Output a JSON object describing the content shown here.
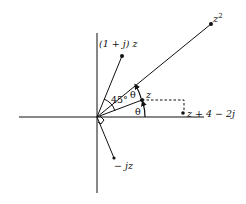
{
  "diagram": {
    "colors": {
      "line": "#111111",
      "background": "#ffffff"
    },
    "origin": {
      "x": 97,
      "y": 117
    },
    "axes": {
      "horizontal": {
        "x1": 19,
        "x2": 204,
        "y": 117
      },
      "vertical": {
        "x": 97,
        "y1": 33,
        "y2": 193
      }
    },
    "points": [
      {
        "id": "z2",
        "label": "z²",
        "label_base": "z",
        "label_sup": "2",
        "x": 211,
        "y": 24
      },
      {
        "id": "one_plus_j_z",
        "label": "(1 + j) z",
        "x": 122,
        "y": 56
      },
      {
        "id": "z",
        "label": "z",
        "x": 142,
        "y": 100
      },
      {
        "id": "z_plus_4_minus_2j",
        "label": "z + 4 − 2j",
        "x": 182,
        "y": 113
      },
      {
        "id": "minus_jz",
        "label": "− jz",
        "x": 114,
        "y": 158
      }
    ],
    "angle_labels": {
      "theta_lower": "θ",
      "theta_upper": "θ",
      "deg45": "45°"
    }
  }
}
